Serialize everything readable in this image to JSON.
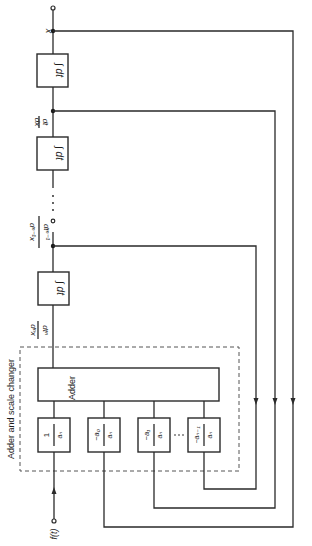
{
  "diagram": {
    "title": "Adder and scale changer",
    "adder_label": "Adder",
    "integrators": [
      {
        "label": "∫ dt",
        "input": "dⁿx / dtⁿ"
      },
      {
        "label": "∫ dt",
        "input": "…"
      },
      {
        "label": "∫ dt",
        "input": "dx / dt"
      }
    ],
    "signals": {
      "output": "x",
      "first_derivative_num": "dx",
      "first_derivative_den": "dt",
      "nminus1_num": "dⁿ⁻¹x",
      "nminus1_den": "dtⁿ⁻¹",
      "nth_num": "dⁿx",
      "nth_den": "dtⁿ",
      "input": "f(t)",
      "ellipsis": "· · ·"
    },
    "scale_blocks": [
      {
        "num": "1",
        "den": "aₙ"
      },
      {
        "num": "−a₀",
        "den": "aₙ"
      },
      {
        "num": "−a₁",
        "den": "aₙ"
      },
      {
        "num": "−aₙ₋₁",
        "den": "aₙ"
      }
    ],
    "scale_ellipsis": "· · ·",
    "orientation": "rotated 90° clockwise (page read sideways)"
  }
}
